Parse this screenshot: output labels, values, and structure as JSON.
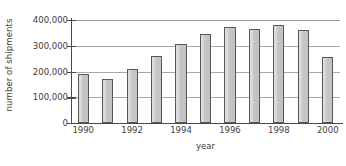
{
  "chart_data": {
    "type": "bar",
    "title": "",
    "xlabel": "year",
    "ylabel": "number of shipments",
    "categories": [
      "1990",
      "1991",
      "1992",
      "1993",
      "1994",
      "1995",
      "1996",
      "1997",
      "1998",
      "1999",
      "2000"
    ],
    "values": [
      190000,
      170000,
      210000,
      260000,
      305000,
      345000,
      372000,
      367000,
      380000,
      360000,
      258000
    ],
    "ylim": [
      0,
      400000
    ],
    "yticks": [
      0,
      100000,
      200000,
      300000,
      400000
    ],
    "ytick_labels": [
      "0",
      "100,000",
      "200,000",
      "300,000",
      "400,000"
    ],
    "xticks_shown": [
      "1990",
      "1992",
      "1994",
      "1996",
      "1998",
      "2000"
    ],
    "grid": true,
    "legend": "none",
    "bar_fill_color": "#c9c9c9",
    "bar_edge_color": "#585858",
    "gridline_color": "#a8a8a8",
    "axis_color": "#4a4a4a",
    "background_color": "#ffffff"
  }
}
